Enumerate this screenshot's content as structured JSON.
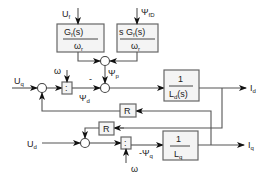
{
  "diagram": {
    "inputs": {
      "uf": {
        "label": "U",
        "sub": "f"
      },
      "psi_fd": {
        "label": "Ψ",
        "sub": "fD"
      },
      "uq": {
        "label": "U",
        "sub": "q"
      },
      "ud": {
        "label": "U",
        "sub": "d"
      },
      "omega_top": {
        "label": "ω"
      },
      "omega_bottom": {
        "label": "ω"
      }
    },
    "blocks": {
      "gf": {
        "num": "G",
        "num_sub": "f",
        "num_tail": "(s)",
        "den": "ω",
        "den_sub": "r"
      },
      "sgf": {
        "num": "s G",
        "num_sub": "f",
        "num_tail": "(s)",
        "den": "ω",
        "den_sub": "r"
      },
      "ld": {
        "num": "1",
        "den": "L",
        "den_sub": "d",
        "den_tail": "(s)"
      },
      "lq": {
        "num": "1",
        "den": "L",
        "den_sub": "q"
      },
      "r_upper": {
        "label": "R"
      },
      "r_lower": {
        "label": "R"
      },
      "div_top": {
        "label": ":"
      },
      "div_bottom": {
        "label": ":"
      }
    },
    "signals": {
      "psi_p": {
        "label": "Ψ",
        "sub": "p"
      },
      "psi_d": {
        "label": "Ψ",
        "sub": "d"
      },
      "neg_psi_q": {
        "label": "-Ψ",
        "sub": "q"
      },
      "minus_sign": "-"
    },
    "outputs": {
      "id": {
        "label": "I",
        "sub": "d"
      },
      "iq": {
        "label": "I",
        "sub": "q"
      }
    }
  }
}
